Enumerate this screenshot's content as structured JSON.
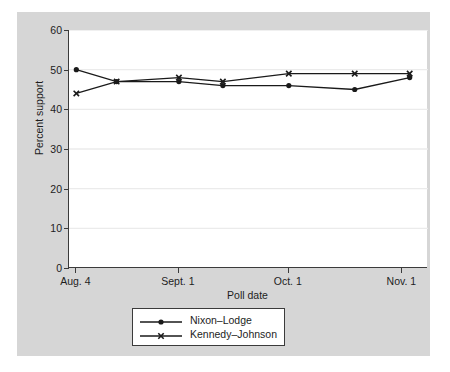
{
  "chart_data": {
    "type": "line",
    "title": "",
    "xlabel": "Poll date",
    "ylabel": "Percent support",
    "ylim": [
      0,
      60
    ],
    "yticks": [
      0,
      10,
      20,
      30,
      40,
      50,
      60
    ],
    "ytick_labels": [
      "0",
      "10",
      "20",
      "30",
      "40",
      "50",
      "60"
    ],
    "xtick_labels": [
      "Aug. 4",
      "Sept. 1",
      "Oct. 1",
      "Nov. 1"
    ],
    "xtick_positions": [
      4,
      32,
      62,
      93
    ],
    "xlim": [
      2,
      100
    ],
    "grid": "horizontal",
    "legend_position": "below-axis-center",
    "x": [
      4,
      15,
      32,
      44,
      62,
      80,
      95
    ],
    "series": [
      {
        "name": "Nixon–Lodge",
        "marker": "circle",
        "color": "#1a1a1a",
        "values": [
          50,
          47,
          47,
          46,
          46,
          45,
          48
        ]
      },
      {
        "name": "Kennedy–Johnson",
        "marker": "x",
        "color": "#1a1a1a",
        "values": [
          44,
          47,
          48,
          47,
          49,
          49,
          49
        ]
      }
    ]
  },
  "colors": {
    "figure_background": "#d6d6d6",
    "plot_background": "#ffffff",
    "axis": "#3b3b3b",
    "gridline": "#ebebeb",
    "text": "#1d1d1d",
    "line": "#1a1a1a"
  }
}
